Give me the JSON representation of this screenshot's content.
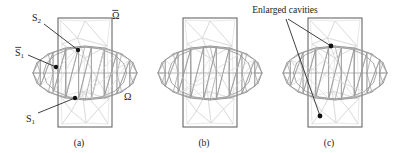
{
  "figure": {
    "title_present": false,
    "background_color": "#ffffff",
    "panels": [
      {
        "id": "a",
        "caption": "(a)",
        "caption_x": 79,
        "caption_y": 146,
        "rect": {
          "x": 58,
          "y": 18,
          "w": 54,
          "h": 109
        },
        "lens_cx": 85,
        "lens_cy": 73,
        "lens_rx": 52,
        "lens_ry": 27,
        "dots": [
          {
            "x": 78,
            "y": 50,
            "r": 2.2,
            "name": "node-s2"
          },
          {
            "x": 56,
            "y": 67,
            "r": 2.2,
            "name": "node-s1bar"
          },
          {
            "x": 75,
            "y": 98,
            "r": 2.2,
            "name": "node-s1"
          }
        ],
        "leaders": [
          {
            "from_x": 44,
            "from_y": 24,
            "to_x": 78,
            "to_y": 50,
            "name": "leader-s2"
          },
          {
            "from_x": 28,
            "from_y": 55,
            "to_x": 56,
            "to_y": 67,
            "name": "leader-s1bar"
          },
          {
            "from_x": 38,
            "from_y": 113,
            "to_x": 75,
            "to_y": 98,
            "name": "leader-s1"
          }
        ],
        "labels": [
          {
            "text": "S",
            "sub": "2",
            "bar": false,
            "x": 32,
            "y": 21,
            "name": "label-s2"
          },
          {
            "text": "S",
            "sub": "1",
            "bar": true,
            "x": 15,
            "y": 56,
            "name": "label-s1-bar"
          },
          {
            "text": "S",
            "sub": "1",
            "bar": false,
            "x": 26,
            "y": 122,
            "name": "label-s1"
          },
          {
            "text": "Ω",
            "sub": "",
            "bar": true,
            "x": 112,
            "y": 19,
            "name": "label-omega-bar"
          },
          {
            "text": "Ω",
            "sub": "",
            "bar": false,
            "x": 124,
            "y": 100,
            "name": "label-omega"
          }
        ]
      },
      {
        "id": "b",
        "caption": "(b)",
        "caption_x": 204,
        "caption_y": 146,
        "rect": {
          "x": 183,
          "y": 18,
          "w": 54,
          "h": 109
        },
        "lens_cx": 210,
        "lens_cy": 73,
        "lens_rx": 52,
        "lens_ry": 27,
        "dots": [],
        "leaders": [],
        "labels": []
      },
      {
        "id": "c",
        "caption": "(c)",
        "caption_x": 329,
        "caption_y": 146,
        "rect": {
          "x": 308,
          "y": 18,
          "w": 54,
          "h": 109
        },
        "lens_cx": 335,
        "lens_cy": 73,
        "lens_rx": 52,
        "lens_ry": 27,
        "dots": [
          {
            "x": 331,
            "y": 46,
            "r": 2.4,
            "name": "node-enlarged-cavity-top"
          },
          {
            "x": 320,
            "y": 116,
            "r": 2.4,
            "name": "node-enlarged-cavity-bottom"
          }
        ],
        "leaders": [
          {
            "from_x": 288,
            "from_y": 19,
            "to_x": 331,
            "to_y": 46,
            "name": "leader-cavity-top"
          },
          {
            "from_x": 286,
            "from_y": 19,
            "to_x": 320,
            "to_y": 116,
            "name": "leader-cavity-bottom"
          }
        ],
        "labels": []
      }
    ],
    "annotations": [
      {
        "text": "Enlarged cavities",
        "x": 285,
        "y": 13,
        "name": "enlarged-cavities-label"
      }
    ],
    "colors": {
      "rectangle_stroke": "#595959",
      "lens_stroke": "#8a8a8a",
      "mesh_front_stroke": "#9a9a9a",
      "mesh_back_stroke": "#d6d6d6",
      "dot_fill": "#111111",
      "leader_stroke": "#2b2b2b",
      "text": "#1b1b1b",
      "background": "#ffffff"
    },
    "stroke_widths": {
      "rectangle": 1.0,
      "lens": 0.9,
      "mesh_front": 0.7,
      "mesh_back": 0.6,
      "leader": 0.9
    }
  }
}
